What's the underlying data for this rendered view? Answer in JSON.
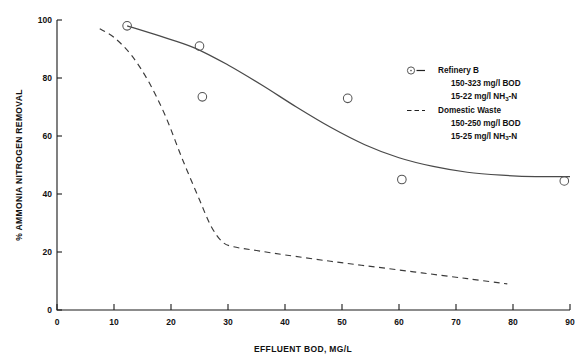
{
  "chart_data": {
    "type": "scatter",
    "title": "",
    "xlabel": "EFFLUENT BOD, MG/L",
    "ylabel": "% AMMONIA NITROGEN REMOVAL",
    "xlim": [
      0,
      90
    ],
    "ylim": [
      0,
      100
    ],
    "xticks": [
      0,
      10,
      20,
      30,
      40,
      50,
      60,
      70,
      80,
      90
    ],
    "yticks": [
      0,
      20,
      40,
      60,
      80,
      100
    ],
    "grid": false,
    "legend_position": "right",
    "series": [
      {
        "name": "Refinery B",
        "style": "solid-line-with-open-circle-markers",
        "detail_line_1": "150-323 mg/l BOD",
        "detail_line_2_prefix": "15-22 mg/l NH",
        "detail_line_2_sub": "3",
        "detail_line_2_suffix": "-N",
        "points": [
          {
            "x": 12.3,
            "y": 98
          },
          {
            "x": 25.0,
            "y": 91
          },
          {
            "x": 25.5,
            "y": 73.5
          },
          {
            "x": 51.0,
            "y": 73
          },
          {
            "x": 60.5,
            "y": 45
          },
          {
            "x": 89.0,
            "y": 44.5
          }
        ],
        "curve": [
          {
            "x": 12.3,
            "y": 98
          },
          {
            "x": 18.0,
            "y": 94.5
          },
          {
            "x": 24.0,
            "y": 90.5
          },
          {
            "x": 30.0,
            "y": 84.5
          },
          {
            "x": 36.0,
            "y": 77.5
          },
          {
            "x": 42.0,
            "y": 70.0
          },
          {
            "x": 48.0,
            "y": 63.0
          },
          {
            "x": 54.0,
            "y": 57.0
          },
          {
            "x": 60.0,
            "y": 52.5
          },
          {
            "x": 66.0,
            "y": 49.5
          },
          {
            "x": 72.0,
            "y": 47.5
          },
          {
            "x": 78.0,
            "y": 46.5
          },
          {
            "x": 84.0,
            "y": 46.0
          },
          {
            "x": 90.0,
            "y": 46.0
          }
        ]
      },
      {
        "name": "Domestic Waste",
        "style": "dashed-line",
        "detail_line_1": "150-250 mg/l BOD",
        "detail_line_2_prefix": "15-25 mg/l NH",
        "detail_line_2_sub": "3",
        "detail_line_2_suffix": "-N",
        "points": [],
        "curve": [
          {
            "x": 7.5,
            "y": 97.0
          },
          {
            "x": 10.0,
            "y": 94.0
          },
          {
            "x": 13.0,
            "y": 88.0
          },
          {
            "x": 16.0,
            "y": 79.0
          },
          {
            "x": 19.0,
            "y": 67.0
          },
          {
            "x": 22.0,
            "y": 52.0
          },
          {
            "x": 25.0,
            "y": 38.0
          },
          {
            "x": 27.0,
            "y": 29.0
          },
          {
            "x": 29.0,
            "y": 23.5
          },
          {
            "x": 31.0,
            "y": 21.8
          },
          {
            "x": 35.0,
            "y": 20.5
          },
          {
            "x": 40.0,
            "y": 19.0
          },
          {
            "x": 48.0,
            "y": 16.8
          },
          {
            "x": 56.0,
            "y": 14.8
          },
          {
            "x": 64.0,
            "y": 12.8
          },
          {
            "x": 72.0,
            "y": 10.8
          },
          {
            "x": 79.0,
            "y": 9.0
          }
        ]
      }
    ]
  },
  "legend": {
    "entry_1": {
      "marker": "open-circle",
      "dash": "—",
      "label": "Refinery B",
      "detail_1": "150-323 mg/l BOD",
      "detail_2_prefix": "15-22 mg/l NH",
      "detail_2_sub": "3",
      "detail_2_suffix": "-N"
    },
    "entry_2": {
      "dash": "– – –",
      "label": "Domestic Waste",
      "detail_1": "150-250 mg/l BOD",
      "detail_2_prefix": "15-25 mg/l NH",
      "detail_2_sub": "3",
      "detail_2_suffix": "-N"
    }
  },
  "colors": {
    "axis": "#1a1a1a",
    "solid_curve": "#4a4a4a",
    "dashed_curve": "#3a3a3a",
    "marker": "#555555",
    "background": "#ffffff"
  }
}
